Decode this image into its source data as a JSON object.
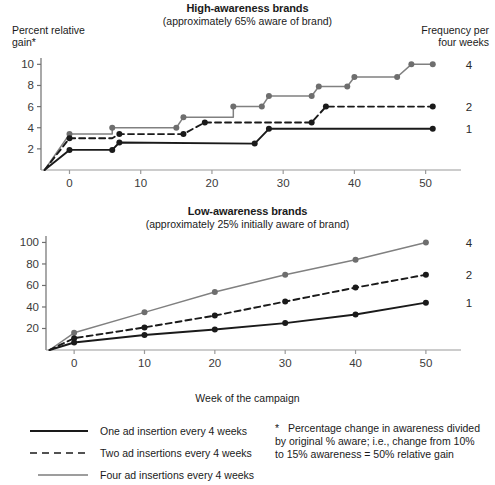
{
  "figure": {
    "x_axis_label": "Week of the campaign"
  },
  "charts": [
    {
      "id": "high-awareness",
      "title": "High-awareness brands",
      "subtitle": "(approximately 65% aware of brand)",
      "ylabel_line1": "Percent relative",
      "ylabel_line2": "gain*",
      "corner_note_line1": "Frequency per",
      "corner_note_line2": "four weeks",
      "series_end_labels": [
        "4",
        "2",
        "1"
      ]
    },
    {
      "id": "low-awareness",
      "title": "Low-awareness brands",
      "subtitle": "(approximately 25% initially aware of brand)",
      "series_end_labels": [
        "4",
        "2",
        "1"
      ]
    }
  ],
  "legend": {
    "items": [
      {
        "label": "One ad insertion every 4 weeks",
        "style": "solid-black",
        "color": "#1a1a1a"
      },
      {
        "label": "Two ad insertions every 4 weeks",
        "style": "dashed-black",
        "color": "#1a1a1a"
      },
      {
        "label": "Four ad insertions every 4 weeks",
        "style": "solid-gray",
        "color": "#808080"
      }
    ]
  },
  "footnote": {
    "marker": "*",
    "text": "Percentage change in awareness divided by original % aware; i.e., change from 10% to 15% awareness = 50% relative gain"
  },
  "chart_data": [
    {
      "type": "line",
      "subtype": "step",
      "title": "High-awareness brands",
      "subtitle": "(approximately 65% aware of brand)",
      "xlabel": "Week of the campaign",
      "ylabel": "Percent relative gain*",
      "xlim": [
        -4,
        53
      ],
      "ylim": [
        0,
        10.6
      ],
      "xticks": [
        0,
        10,
        20,
        30,
        40,
        50
      ],
      "yticks": [
        2,
        4,
        6,
        8,
        10
      ],
      "grid": false,
      "legend_position": "right-end-labels",
      "series": [
        {
          "name": "Four ad insertions every 4 weeks",
          "end_label": "4",
          "color": "#808080",
          "style": "solid",
          "points": [
            {
              "x": -3.5,
              "y": 0
            },
            {
              "x": 0,
              "y": 3.4
            },
            {
              "x": 6,
              "y": 3.4
            },
            {
              "x": 6,
              "y": 4.0
            },
            {
              "x": 15,
              "y": 4.0
            },
            {
              "x": 16,
              "y": 5.0
            },
            {
              "x": 23,
              "y": 5.0
            },
            {
              "x": 23,
              "y": 6.0
            },
            {
              "x": 27,
              "y": 6.0
            },
            {
              "x": 28,
              "y": 7.0
            },
            {
              "x": 34,
              "y": 7.0
            },
            {
              "x": 35,
              "y": 7.9
            },
            {
              "x": 39,
              "y": 7.9
            },
            {
              "x": 40,
              "y": 8.8
            },
            {
              "x": 46,
              "y": 8.8
            },
            {
              "x": 48,
              "y": 10.0
            },
            {
              "x": 51,
              "y": 10.0
            }
          ]
        },
        {
          "name": "Two ad insertions every 4 weeks",
          "end_label": "2",
          "color": "#1a1a1a",
          "style": "dashed",
          "points": [
            {
              "x": -3.5,
              "y": 0
            },
            {
              "x": 0,
              "y": 3.0
            },
            {
              "x": 6,
              "y": 3.0
            },
            {
              "x": 7,
              "y": 3.4
            },
            {
              "x": 16,
              "y": 3.4
            },
            {
              "x": 19,
              "y": 4.5
            },
            {
              "x": 34,
              "y": 4.5
            },
            {
              "x": 36,
              "y": 6.0
            },
            {
              "x": 51,
              "y": 6.0
            }
          ]
        },
        {
          "name": "One ad insertion every 4 weeks",
          "end_label": "1",
          "color": "#1a1a1a",
          "style": "solid",
          "points": [
            {
              "x": -3.5,
              "y": 0
            },
            {
              "x": 0,
              "y": 1.9
            },
            {
              "x": 6,
              "y": 1.9
            },
            {
              "x": 7,
              "y": 2.6
            },
            {
              "x": 26,
              "y": 2.5
            },
            {
              "x": 28,
              "y": 3.9
            },
            {
              "x": 51,
              "y": 3.9
            }
          ]
        }
      ],
      "markers": {
        "Four ad insertions every 4 weeks": [
          {
            "x": 0,
            "y": 3.4
          },
          {
            "x": 6,
            "y": 4.0
          },
          {
            "x": 16,
            "y": 5.0
          },
          {
            "x": 15,
            "y": 4.0
          },
          {
            "x": 23,
            "y": 6.0
          },
          {
            "x": 27,
            "y": 6.0
          },
          {
            "x": 28,
            "y": 7.0
          },
          {
            "x": 34,
            "y": 7.0
          },
          {
            "x": 35,
            "y": 7.9
          },
          {
            "x": 39,
            "y": 7.9
          },
          {
            "x": 40,
            "y": 8.8
          },
          {
            "x": 46,
            "y": 8.8
          },
          {
            "x": 48,
            "y": 10.0
          },
          {
            "x": 51,
            "y": 10.0
          }
        ],
        "Two ad insertions every 4 weeks": [
          {
            "x": 0,
            "y": 3.0
          },
          {
            "x": 7,
            "y": 3.4
          },
          {
            "x": 16,
            "y": 3.4
          },
          {
            "x": 19,
            "y": 4.5
          },
          {
            "x": 34,
            "y": 4.5
          },
          {
            "x": 36,
            "y": 6.0
          },
          {
            "x": 51,
            "y": 6.0
          }
        ],
        "One ad insertion every 4 weeks": [
          {
            "x": 0,
            "y": 1.9
          },
          {
            "x": 6,
            "y": 1.9
          },
          {
            "x": 7,
            "y": 2.6
          },
          {
            "x": 26,
            "y": 2.5
          },
          {
            "x": 28,
            "y": 3.9
          },
          {
            "x": 51,
            "y": 3.9
          }
        ]
      }
    },
    {
      "type": "line",
      "subtype": "curve",
      "title": "Low-awareness brands",
      "subtitle": "(approximately 25% initially aware of brand)",
      "xlabel": "Week of the campaign",
      "ylabel": "",
      "xlim": [
        -4,
        53
      ],
      "ylim": [
        0,
        106
      ],
      "xticks": [
        0,
        10,
        20,
        30,
        40,
        50
      ],
      "yticks": [
        20,
        40,
        60,
        80,
        100
      ],
      "grid": false,
      "legend_position": "right-end-labels",
      "x": [
        0,
        10,
        20,
        30,
        40,
        50
      ],
      "series": [
        {
          "name": "Four ad insertions every 4 weeks",
          "end_label": "4",
          "color": "#808080",
          "style": "solid",
          "values": [
            16,
            35,
            54,
            70,
            84,
            100
          ]
        },
        {
          "name": "Two ad insertions every 4 weeks",
          "end_label": "2",
          "color": "#1a1a1a",
          "style": "dashed",
          "values": [
            11,
            21,
            32,
            45,
            58,
            70
          ]
        },
        {
          "name": "One ad insertion every 4 weeks",
          "end_label": "1",
          "color": "#1a1a1a",
          "style": "solid",
          "values": [
            7,
            14,
            19,
            25,
            33,
            44
          ]
        }
      ]
    }
  ]
}
